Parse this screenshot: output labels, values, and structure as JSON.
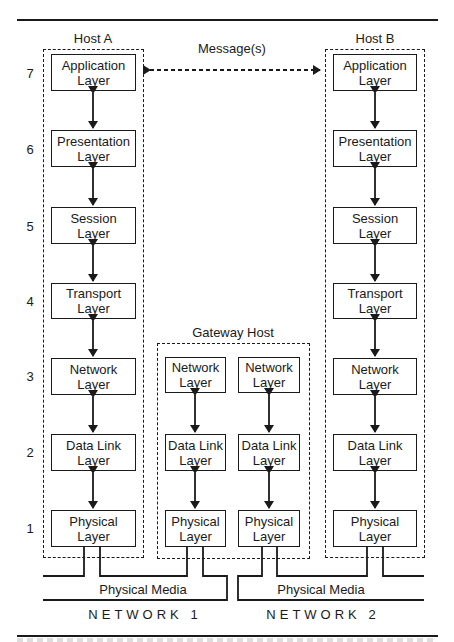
{
  "diagram": {
    "message_label": "Message(s)",
    "layer_numbers": [
      "7",
      "6",
      "5",
      "4",
      "3",
      "2",
      "1"
    ],
    "hosts": [
      {
        "id": "host-a",
        "title": "Host A",
        "layers": [
          {
            "line1": "Application",
            "line2": "Layer"
          },
          {
            "line1": "Presentation",
            "line2": "Layer"
          },
          {
            "line1": "Session",
            "line2": "Layer"
          },
          {
            "line1": "Transport",
            "line2": "Layer"
          },
          {
            "line1": "Network",
            "line2": "Layer"
          },
          {
            "line1": "Data Link",
            "line2": "Layer"
          },
          {
            "line1": "Physical",
            "line2": "Layer"
          }
        ]
      },
      {
        "id": "host-b",
        "title": "Host B",
        "layers": [
          {
            "line1": "Application",
            "line2": "Layer"
          },
          {
            "line1": "Presentation",
            "line2": "Layer"
          },
          {
            "line1": "Session",
            "line2": "Layer"
          },
          {
            "line1": "Transport",
            "line2": "Layer"
          },
          {
            "line1": "Network",
            "line2": "Layer"
          },
          {
            "line1": "Data Link",
            "line2": "Layer"
          },
          {
            "line1": "Physical",
            "line2": "Layer"
          }
        ]
      }
    ],
    "gateway": {
      "title": "Gateway Host",
      "stacks": [
        [
          {
            "line1": "Network",
            "line2": "Layer"
          },
          {
            "line1": "Data Link",
            "line2": "Layer"
          },
          {
            "line1": "Physical",
            "line2": "Layer"
          }
        ],
        [
          {
            "line1": "Network",
            "line2": "Layer"
          },
          {
            "line1": "Data Link",
            "line2": "Layer"
          },
          {
            "line1": "Physical",
            "line2": "Layer"
          }
        ]
      ]
    },
    "media": [
      {
        "label": "Physical Media",
        "network": "NETWORK 1"
      },
      {
        "label": "Physical Media",
        "network": "NETWORK 2"
      }
    ]
  }
}
